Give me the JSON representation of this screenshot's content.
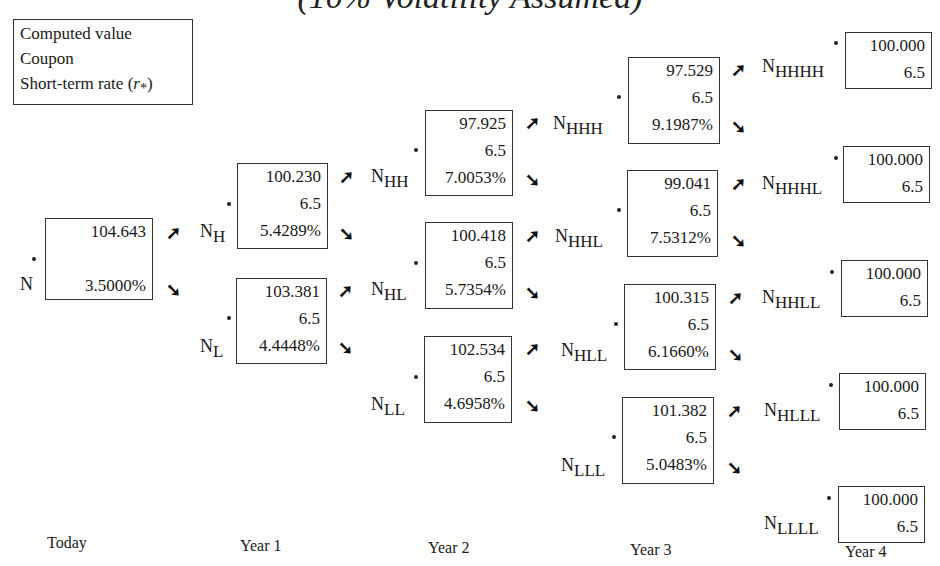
{
  "title": "(10% Volatility Assumed)",
  "legend": {
    "lines": [
      "Computed value",
      "Coupon",
      "Short-term rate (r*)"
    ],
    "line3_text": "Short-term rate (",
    "line3_symbol": "r",
    "line3_sub": "*",
    "line3_close": ")"
  },
  "periods": [
    "Today",
    "Year 1",
    "Year 2",
    "Year 3",
    "Year 4"
  ],
  "arrows": {
    "up": "➚",
    "down": "➘"
  },
  "nodes": {
    "N": {
      "base": "N",
      "sub": "",
      "value": "104.643",
      "coupon": "",
      "rate": "3.5000%"
    },
    "NH": {
      "base": "N",
      "sub": "H",
      "value": "100.230",
      "coupon": "6.5",
      "rate": "5.4289%"
    },
    "NL": {
      "base": "N",
      "sub": "L",
      "value": "103.381",
      "coupon": "6.5",
      "rate": "4.4448%"
    },
    "NHH": {
      "base": "N",
      "sub": "HH",
      "value": "97.925",
      "coupon": "6.5",
      "rate": "7.0053%"
    },
    "NHL": {
      "base": "N",
      "sub": "HL",
      "value": "100.418",
      "coupon": "6.5",
      "rate": "5.7354%"
    },
    "NLL": {
      "base": "N",
      "sub": "LL",
      "value": "102.534",
      "coupon": "6.5",
      "rate": "4.6958%"
    },
    "NHHH": {
      "base": "N",
      "sub": "HHH",
      "value": "97.529",
      "coupon": "6.5",
      "rate": "9.1987%"
    },
    "NHHL": {
      "base": "N",
      "sub": "HHL",
      "value": "99.041",
      "coupon": "6.5",
      "rate": "7.5312%"
    },
    "NHLL": {
      "base": "N",
      "sub": "HLL",
      "value": "100.315",
      "coupon": "6.5",
      "rate": "6.1660%"
    },
    "NLLL": {
      "base": "N",
      "sub": "LLL",
      "value": "101.382",
      "coupon": "6.5",
      "rate": "5.0483%"
    },
    "NHHHH": {
      "base": "N",
      "sub": "HHHH",
      "value": "100.000",
      "coupon": "6.5"
    },
    "NHHHL": {
      "base": "N",
      "sub": "HHHL",
      "value": "100.000",
      "coupon": "6.5"
    },
    "NHHLL": {
      "base": "N",
      "sub": "HHLL",
      "value": "100.000",
      "coupon": "6.5"
    },
    "NHLLL": {
      "base": "N",
      "sub": "HLLL",
      "value": "100.000",
      "coupon": "6.5"
    },
    "NLLLL": {
      "base": "N",
      "sub": "LLLL",
      "value": "100.000",
      "coupon": "6.5"
    }
  }
}
